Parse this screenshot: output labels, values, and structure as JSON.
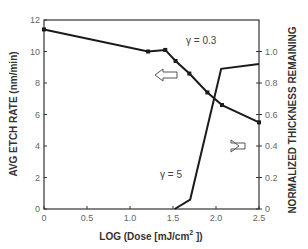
{
  "chart_data": {
    "type": "line",
    "title": "",
    "xlabel": "LOG (Dose  [mJ/cm² ])",
    "xlabel_main": "LOG (Dose  [mJ/cm",
    "xlabel_sup": "2",
    "xlabel_end": " ])",
    "ylabel": "AVG ETCH RATE (nm/min)",
    "y2label": "NORMALIZED THICKNESS REMAINING",
    "xlim": [
      0,
      2.5
    ],
    "ylim": [
      0,
      12
    ],
    "y2lim": [
      0,
      1.2
    ],
    "x_ticks": [
      "0",
      "0.5",
      "1.0",
      "1.5",
      "2.0",
      "2.5"
    ],
    "y_ticks": [
      "0",
      "2",
      "4",
      "6",
      "8",
      "10",
      "12"
    ],
    "y2_ticks": [
      "0",
      "0.2",
      "0.4",
      "0.6",
      "0.8",
      "1.0"
    ],
    "grid": false,
    "series": [
      {
        "name": "Avg etch rate (γ = 0.3)",
        "axis": "left",
        "x": [
          0,
          1.21,
          1.41,
          1.53,
          1.69,
          1.9,
          2.07,
          2.5
        ],
        "values": [
          11.4,
          10.0,
          10.1,
          9.4,
          8.6,
          7.4,
          6.6,
          5.5
        ]
      },
      {
        "name": "Normalized thickness remaining (γ = 5)",
        "axis": "right",
        "x": [
          1.52,
          1.7,
          2.06,
          2.5
        ],
        "values": [
          0,
          0.06,
          0.89,
          0.92
        ]
      }
    ],
    "annotations": [
      {
        "text": "γ = 0.3",
        "x": 2.0,
        "y": 10.8
      },
      {
        "text": "γ = 5",
        "x": 1.35,
        "y": 2.0
      },
      {
        "text": "⇦ (etch rate → left axis)",
        "x": 1.5,
        "y": 8.0
      },
      {
        "text": "⇨ (thickness → right axis)",
        "x": 2.25,
        "y": 4.3
      }
    ]
  },
  "labels": {
    "gamma_high": "γ = 0.3",
    "gamma_low": "γ = 5"
  }
}
